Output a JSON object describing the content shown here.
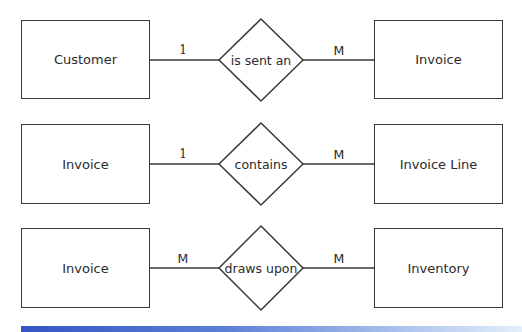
{
  "diagram": {
    "type": "entity-relationship",
    "rows": [
      {
        "left_entity": "Customer",
        "relationship": "is sent an",
        "right_entity": "Invoice",
        "left_cardinality": "1",
        "right_cardinality": "M"
      },
      {
        "left_entity": "Invoice",
        "relationship": "contains",
        "right_entity": "Invoice Line",
        "left_cardinality": "1",
        "right_cardinality": "M"
      },
      {
        "left_entity": "Invoice",
        "relationship": "draws upon",
        "right_entity": "Inventory",
        "left_cardinality": "M",
        "right_cardinality": "M"
      }
    ],
    "colors": {
      "stroke": "#3a3a3a",
      "text": "#2b2b2b",
      "bar_start": "#3556c4",
      "bar_end": "#e4eefb"
    }
  }
}
